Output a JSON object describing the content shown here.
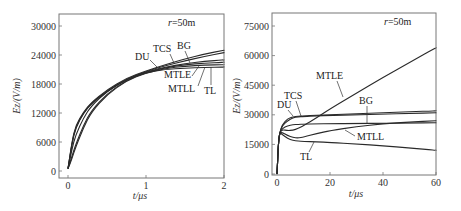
{
  "chart_data": [
    {
      "type": "line",
      "title": "",
      "annotation": "r=50m",
      "xlabel": "t/μs",
      "ylabel": "Ez/(V/m)",
      "xlim": [
        0,
        2
      ],
      "ylim": [
        0,
        32000
      ],
      "xticks": [
        0,
        1,
        2
      ],
      "yticks": [
        0,
        6000,
        12000,
        18000,
        24000,
        30000
      ],
      "grid": false,
      "legend": "inline labels",
      "x": [
        0,
        0.05,
        0.1,
        0.2,
        0.3,
        0.5,
        0.75,
        1.0,
        1.25,
        1.5,
        1.75,
        2.0
      ],
      "series": [
        {
          "name": "DU",
          "values": [
            500,
            5500,
            9000,
            12000,
            14000,
            16500,
            19000,
            20500,
            21500,
            22200,
            22700,
            23000
          ]
        },
        {
          "name": "TCS",
          "values": [
            500,
            6000,
            9500,
            12200,
            14200,
            16800,
            19200,
            20700,
            22000,
            23200,
            24200,
            25000
          ]
        },
        {
          "name": "BG",
          "values": [
            500,
            4500,
            7500,
            11000,
            13500,
            16500,
            19000,
            20600,
            21800,
            22800,
            23700,
            24500
          ]
        },
        {
          "name": "MTLE",
          "values": [
            500,
            3000,
            5500,
            9500,
            12500,
            16000,
            18800,
            20400,
            21400,
            22000,
            22300,
            22500
          ]
        },
        {
          "name": "MTLL",
          "values": [
            500,
            2500,
            5000,
            9000,
            12200,
            15800,
            18700,
            20300,
            21200,
            21700,
            21900,
            22000
          ]
        },
        {
          "name": "TL",
          "values": [
            500,
            5800,
            9200,
            12000,
            14000,
            16600,
            19000,
            20400,
            21000,
            21300,
            21400,
            21500
          ]
        }
      ]
    },
    {
      "type": "line",
      "title": "",
      "annotation": "r=50m",
      "xlabel": "t/μs",
      "ylabel": "Ez/(V/m)",
      "xlim": [
        0,
        60
      ],
      "ylim": [
        0,
        80000
      ],
      "xticks": [
        0,
        20,
        40,
        60
      ],
      "yticks": [
        0,
        15000,
        30000,
        45000,
        60000,
        75000
      ],
      "grid": false,
      "legend": "inline labels",
      "x": [
        0,
        0.5,
        1,
        2,
        4,
        6,
        8,
        10,
        15,
        20,
        30,
        40,
        50,
        60
      ],
      "series": [
        {
          "name": "DU",
          "values": [
            0,
            15000,
            21000,
            25000,
            28000,
            29000,
            29300,
            29500,
            29800,
            30000,
            30500,
            31000,
            31500,
            32000
          ]
        },
        {
          "name": "TCS",
          "values": [
            0,
            15000,
            21000,
            24500,
            27000,
            28500,
            29000,
            29200,
            29500,
            29700,
            30000,
            30300,
            30700,
            31000
          ]
        },
        {
          "name": "BG",
          "values": [
            0,
            15000,
            21000,
            23000,
            24500,
            25000,
            25200,
            25300,
            25400,
            25500,
            25600,
            25700,
            25800,
            26000
          ]
        },
        {
          "name": "MTLE",
          "values": [
            0,
            15000,
            21000,
            22500,
            22000,
            22200,
            23000,
            24500,
            28500,
            33000,
            41000,
            49000,
            56500,
            64000
          ]
        },
        {
          "name": "MTLL",
          "values": [
            0,
            15000,
            21000,
            21000,
            19500,
            18500,
            18200,
            18800,
            20500,
            22000,
            24000,
            25500,
            26300,
            27000
          ]
        },
        {
          "name": "TL",
          "values": [
            0,
            15000,
            21000,
            20000,
            18000,
            17000,
            16700,
            16500,
            16300,
            16000,
            15200,
            14300,
            13200,
            12000
          ]
        }
      ]
    }
  ],
  "labels": {
    "left": {
      "annotation": "r=50m",
      "xlabel": "t/μs",
      "ylabel": "Ez/(V/m)",
      "xticks": [
        "0",
        "1",
        "2"
      ],
      "yticks": [
        "0",
        "6000",
        "12000",
        "18000",
        "24000",
        "30000"
      ],
      "curves": [
        "DU",
        "TCS",
        "BG",
        "MTLE",
        "MTLL",
        "TL"
      ]
    },
    "right": {
      "annotation": "r=50m",
      "xlabel": "t/μs",
      "ylabel": "Ez/(V/m)",
      "xticks": [
        "0",
        "20",
        "40",
        "60"
      ],
      "yticks": [
        "0",
        "15000",
        "30000",
        "45000",
        "60000",
        "75000"
      ],
      "curves": [
        "DU",
        "TCS",
        "MTLE",
        "BG",
        "MTLL",
        "TL"
      ]
    }
  }
}
